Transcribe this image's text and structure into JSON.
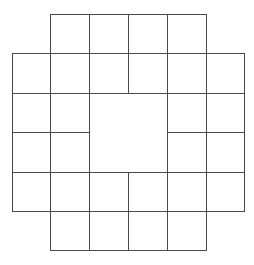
{
  "diagram": {
    "line_color": "#4a4a4a",
    "background": "#ffffff",
    "col_edges": [
      12,
      50,
      89,
      128,
      167,
      206,
      244
    ],
    "row_edges": [
      14,
      53,
      93,
      132,
      172,
      211,
      250
    ],
    "rows": [
      [
        0,
        1,
        1,
        1,
        1,
        0
      ],
      [
        1,
        1,
        1,
        1,
        1,
        1
      ],
      [
        1,
        1,
        2,
        2,
        1,
        1
      ],
      [
        1,
        1,
        2,
        2,
        1,
        1
      ],
      [
        1,
        1,
        1,
        1,
        1,
        1
      ],
      [
        0,
        1,
        1,
        1,
        1,
        0
      ]
    ],
    "merged_block": {
      "row": 2,
      "col": 2,
      "rowspan": 2,
      "colspan": 2
    },
    "small_cell_count": 28,
    "large_cell_count": 1
  }
}
